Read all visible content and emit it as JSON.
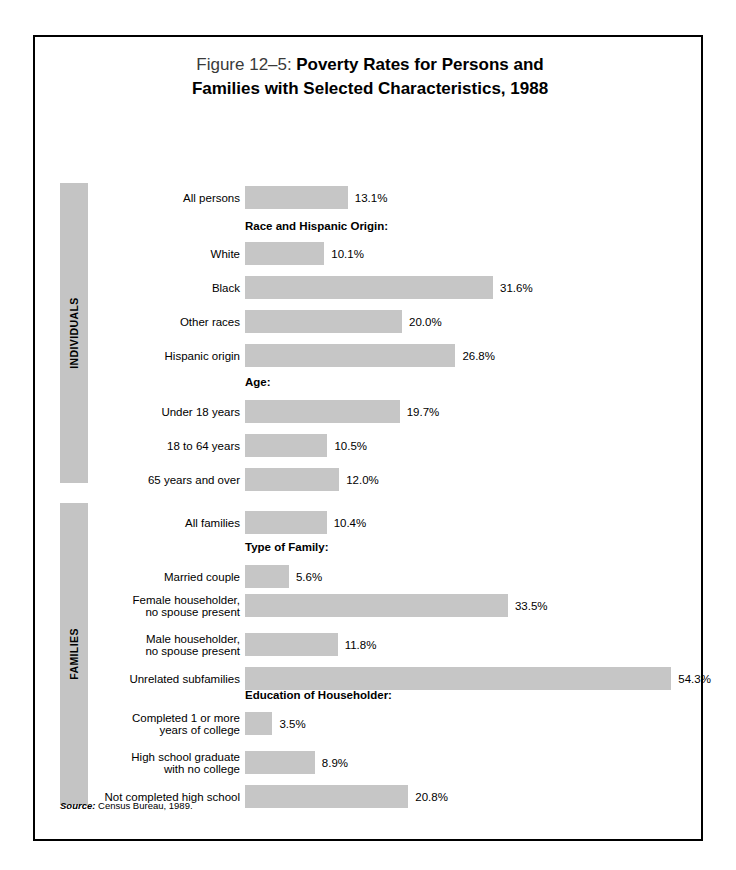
{
  "title": {
    "figure_number": "Figure 12–5:",
    "heading_line1": "Poverty Rates for Persons and",
    "heading_line2": "Families with Selected Characteristics, 1988"
  },
  "groups": [
    {
      "id": "individuals",
      "label": "INDIVIDUALS"
    },
    {
      "id": "families",
      "label": "FAMILIES"
    }
  ],
  "source": {
    "label": "Source:",
    "text": " Census Bureau, 1989."
  },
  "colors": {
    "bar": "#c6c6c6",
    "band": "#c4c4c4",
    "border": "#000000",
    "background": "#ffffff"
  },
  "chart_data": {
    "type": "bar",
    "title": "Figure 12–5: Poverty Rates for Persons and Families with Selected Characteristics, 1988",
    "xlabel": "",
    "ylabel": "",
    "orientation": "horizontal",
    "unit": "percent",
    "xlim": [
      0,
      56
    ],
    "grid": false,
    "legend": "none",
    "source": "Source: Census Bureau, 1989.",
    "groups": [
      "INDIVIDUALS",
      "FAMILIES"
    ],
    "categories": [
      "All persons",
      "White",
      "Black",
      "Other races",
      "Hispanic origin",
      "Under 18 years",
      "18 to 64 years",
      "65 years and over",
      "All families",
      "Married couple",
      "Female householder, no spouse present",
      "Male householder, no spouse present",
      "Unrelated subfamilies",
      "Completed 1 or more years of college",
      "High school graduate with no college",
      "Not completed high school"
    ],
    "values": [
      13.1,
      10.1,
      31.6,
      20.0,
      26.8,
      19.7,
      10.5,
      12.0,
      10.4,
      5.6,
      33.5,
      11.8,
      54.3,
      3.5,
      8.9,
      20.8
    ],
    "section_headers": [
      "Race and Hispanic Origin:",
      "Age:",
      "Type of Family:",
      "Education of Householder:"
    ]
  },
  "rows": [
    {
      "label": "All persons",
      "value": 13.1,
      "value_text": "13.1%",
      "group": "individuals",
      "top": 149
    },
    {
      "label": "White",
      "value": 10.1,
      "value_text": "10.1%",
      "group": "individuals",
      "top": 205
    },
    {
      "label": "Black",
      "value": 31.6,
      "value_text": "31.6%",
      "group": "individuals",
      "top": 239
    },
    {
      "label": "Other races",
      "value": 20.0,
      "value_text": "20.0%",
      "group": "individuals",
      "top": 273
    },
    {
      "label": "Hispanic origin",
      "value": 26.8,
      "value_text": "26.8%",
      "group": "individuals",
      "top": 307
    },
    {
      "label": "Under 18 years",
      "value": 19.7,
      "value_text": "19.7%",
      "group": "individuals",
      "top": 363
    },
    {
      "label": "18 to 64 years",
      "value": 10.5,
      "value_text": "10.5%",
      "group": "individuals",
      "top": 397
    },
    {
      "label": "65 years and over",
      "value": 12.0,
      "value_text": "12.0%",
      "group": "individuals",
      "top": 431
    },
    {
      "label": "All families",
      "value": 10.4,
      "value_text": "10.4%",
      "group": "families",
      "top": 474
    },
    {
      "label": "Married couple",
      "value": 5.6,
      "value_text": "5.6%",
      "group": "families",
      "top": 528
    },
    {
      "label": "Female householder,\nno spouse present",
      "value": 33.5,
      "value_text": "33.5%",
      "group": "families",
      "top": 557
    },
    {
      "label": "Male householder,\nno spouse present",
      "value": 11.8,
      "value_text": "11.8%",
      "group": "families",
      "top": 596
    },
    {
      "label": "Unrelated subfamilies",
      "value": 54.3,
      "value_text": "54.3%",
      "group": "families",
      "top": 630
    },
    {
      "label": "Completed 1 or more\nyears of college",
      "value": 3.5,
      "value_text": "3.5%",
      "group": "families",
      "top": 675
    },
    {
      "label": "High school graduate\nwith no college",
      "value": 8.9,
      "value_text": "8.9%",
      "group": "families",
      "top": 714
    },
    {
      "label": "Not completed high school",
      "value": 20.8,
      "value_text": "20.8%",
      "group": "families",
      "top": 748
    }
  ],
  "headers": [
    {
      "label": "Race and Hispanic Origin:",
      "top": 183
    },
    {
      "label": "Age:",
      "top": 339
    },
    {
      "label": "Type of Family:",
      "top": 504
    },
    {
      "label": "Education of Householder:",
      "top": 652
    }
  ],
  "bands": [
    {
      "group": "individuals",
      "top": 146,
      "height": 300
    },
    {
      "group": "families",
      "top": 466,
      "height": 302
    }
  ]
}
